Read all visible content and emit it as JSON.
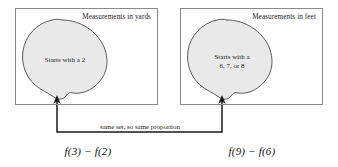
{
  "diagram": {
    "colors": {
      "blob_fill": "#e9e9e9",
      "blob_stroke": "#4a4a4a",
      "box_stroke": "#8a8a8a",
      "connector_stroke": "#1a1a1a",
      "text": "#1a1a1a",
      "background": "#ffffff"
    },
    "groups": [
      {
        "id": "yards",
        "caption": "Measurements in yards",
        "blob_label": "Starts with a 2",
        "formula": "f(3) − f(2)"
      },
      {
        "id": "feet",
        "caption": "Measurements in feet",
        "blob_label": "Starts with a\n6, 7, or 8",
        "formula": "f(9) − f(6)"
      }
    ],
    "connector": {
      "caption": "same set, so same proportion",
      "arrow_left_x": 57,
      "arrow_right_x": 222,
      "arrow_tip_y": 97,
      "line_y": 132
    }
  }
}
